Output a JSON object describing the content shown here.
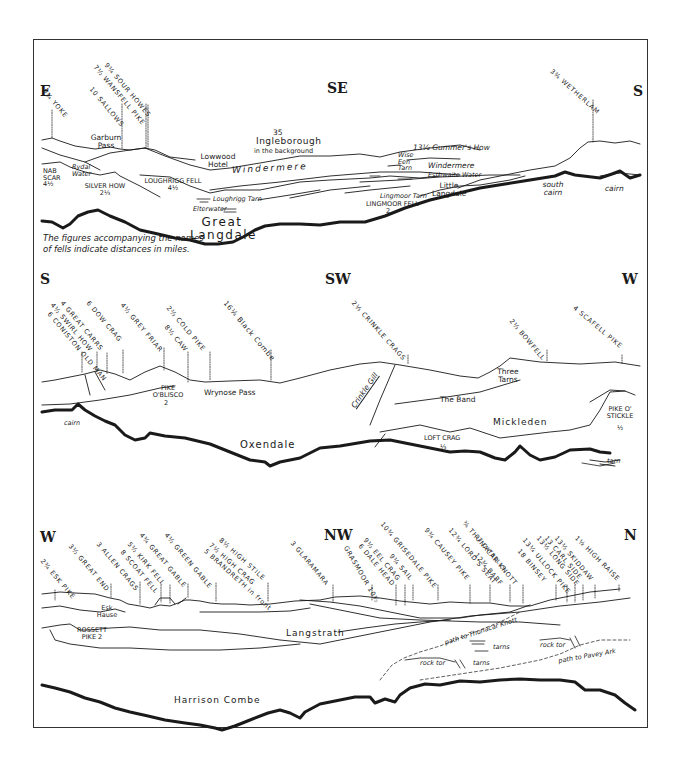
{
  "panels": [
    {
      "compass": {
        "left": "E",
        "mid": "SE",
        "right": "S"
      },
      "fells": [
        {
          "dist": "9¾",
          "name": "YOKE"
        },
        {
          "dist": "10",
          "name": "SALLOWS"
        },
        {
          "dist": "7½",
          "name": "WANSFELL PIKE"
        },
        {
          "dist": "9¼",
          "name": "SOUR HOWES"
        },
        {
          "dist": "3¾",
          "name": "WETHERLAM"
        }
      ],
      "places": {
        "garburn": "Garburn Pass",
        "ingleborough_dist": "35",
        "ingleborough": "Ingleborough",
        "ingleborough_note": "in the background",
        "lowwood": "Lowwood Hotel",
        "windermere1": "Windermere",
        "wise_een": "Wise Een Tarn",
        "windermere2": "Windermere",
        "gummers": "13½ Gummer's How",
        "esthwaite": "Esthwaite Water",
        "nab_scar": "NAB SCAR 4½",
        "rydal": "Rydal Water",
        "silver_how": "SILVER HOW 2⅓",
        "loughrigg_fell": "LOUGHRIGG FELL 4½",
        "loughrigg_tarn": "Loughrigg Tarn",
        "elterwater": "Elterwater",
        "little_langdale": "Little Langdale",
        "lingmoor_tarn": "Lingmoor Tarn",
        "lingmoor_fell": "LINGMOOR FELL",
        "lingmoor_dist": "2",
        "great_langdale": "Great Langdale",
        "south_cairn": "south cairn",
        "cairn": "cairn"
      },
      "note": "The figures accompanying the names of fells indicate distances in miles."
    },
    {
      "compass": {
        "left": "S",
        "mid": "SW",
        "right": "W"
      },
      "fells": [
        {
          "dist": "6",
          "name": "CONISTON OLD MAN"
        },
        {
          "dist": "4½",
          "name": "SWIRL HOW"
        },
        {
          "dist": "4",
          "name": "GREAT CARRS"
        },
        {
          "dist": "6",
          "name": "DOW CRAG"
        },
        {
          "dist": "4½",
          "name": "GREY FRIAR"
        },
        {
          "dist": "8½",
          "name": "CAW"
        },
        {
          "dist": "2⅔",
          "name": "COLD PIKE"
        },
        {
          "dist": "16¼",
          "name": "Black Combe"
        },
        {
          "dist": "2⅓",
          "name": "CRINKLE CRAGS"
        },
        {
          "dist": "2⅓",
          "name": "BOWFELL"
        },
        {
          "dist": "4",
          "name": "SCAFELL PIKE"
        }
      ],
      "places": {
        "pike_oblisco": "PIKE O'BLISCO",
        "pike_oblisco_dist": "2",
        "wrynose": "Wrynose Pass",
        "cairn": "cairn",
        "crinkle_gill": "Crinkle Gill",
        "three_tarns": "Three Tarns",
        "the_band": "The Band",
        "mickleden": "Mickleden",
        "pike_ostickle": "PIKE O' STICKLE",
        "pike_ostickle_dist": "½",
        "loft_crag": "LOFT CRAG",
        "loft_crag_dist": "⅓",
        "oxendale": "Oxendale",
        "tarn": "tarn"
      }
    },
    {
      "compass": {
        "left": "W",
        "mid": "NW",
        "right": "N"
      },
      "fells": [
        {
          "dist": "2¾",
          "name": "ESK PIKE"
        },
        {
          "dist": "3½",
          "name": "GREAT END"
        },
        {
          "dist": "3",
          "name": "ALLEN CRAGS"
        },
        {
          "dist": "8",
          "name": "SCOAT FELL"
        },
        {
          "dist": "5½",
          "name": "KIRK FELL"
        },
        {
          "dist": "4¾",
          "name": "GREAT GABLE"
        },
        {
          "dist": "4½",
          "name": "GREEN GABLE"
        },
        {
          "dist": "5",
          "name": "BRANDRETH in front"
        },
        {
          "dist": "7½",
          "name": "HIGH CRAG"
        },
        {
          "dist": "8½",
          "name": "HIGH STILE"
        },
        {
          "dist": "3",
          "name": "GLARAMARA"
        },
        {
          "dist": "10½",
          "name": "GRASMOOR"
        },
        {
          "dist": "6",
          "name": "DALE HEAD"
        },
        {
          "dist": "9½",
          "name": "EEL CRAG"
        },
        {
          "dist": "9¼",
          "name": "SAIL"
        },
        {
          "dist": "10¾",
          "name": "GRISEDALE PIKE"
        },
        {
          "dist": "9¾",
          "name": "CAUSEY PIKE"
        },
        {
          "dist": "12¾",
          "name": "LORD'S SEAT"
        },
        {
          "dist": "12¾",
          "name": "BARF"
        },
        {
          "dist": "12",
          "name": "CATBELLS"
        },
        {
          "dist": "¾",
          "name": "THUNACAR KNOTT"
        },
        {
          "dist": "18",
          "name": "BINSEY"
        },
        {
          "dist": "13¼",
          "name": "ULLOCK PIKE"
        },
        {
          "dist": "13½",
          "name": "LONG SIDE"
        },
        {
          "dist": "13",
          "name": "CARL SIDE"
        },
        {
          "dist": "13½",
          "name": "SKIDDAW"
        },
        {
          "dist": "1½",
          "name": "HIGH RAISE"
        }
      ],
      "places": {
        "esk_hause": "Esk Hause",
        "rossett": "ROSSETT PIKE 2",
        "langstrath": "Langstrath",
        "path_thunacar": "path to Thunacar Knott",
        "tarns1": "tarns",
        "rock_tor1": "rock tor",
        "path_pavey": "path to Pavey Ark",
        "rock_tor2": "rock tor",
        "tarns2": "tarns",
        "harrison_combe": "Harrison Combe"
      }
    }
  ]
}
